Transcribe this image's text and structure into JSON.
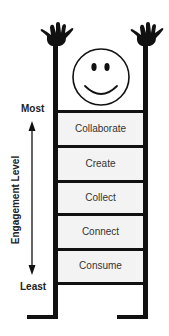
{
  "diagram": {
    "type": "engagement-ladder",
    "axis": {
      "title": "Engagement Level",
      "top_label": "Most",
      "bottom_label": "Least",
      "direction": "bidirectional-vertical"
    },
    "rungs": [
      {
        "label": "Collaborate",
        "rank": 5
      },
      {
        "label": "Create",
        "rank": 4
      },
      {
        "label": "Collect",
        "rank": 3
      },
      {
        "label": "Connect",
        "rank": 2
      },
      {
        "label": "Consume",
        "rank": 1
      }
    ],
    "decorations": {
      "figure": "smiley-face-on-ladder",
      "hands": "raised-hands-on-rail-tops"
    },
    "colors": {
      "ink": "#111111",
      "rung_fill": "#f3f3f3",
      "text": "#333333",
      "background": "#ffffff"
    }
  }
}
